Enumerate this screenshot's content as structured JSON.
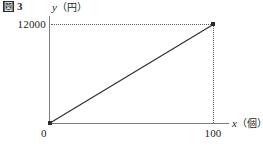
{
  "figure": {
    "caption_marker": "図",
    "caption_number": "3"
  },
  "chart_data": {
    "type": "line",
    "title": "",
    "xlabel": "x（個）",
    "xlabel_var": "x",
    "xlabel_unit": "（個）",
    "ylabel": "y（円）",
    "ylabel_var": "y",
    "ylabel_unit": "（円）",
    "origin_label": "0",
    "x_ticks": [
      "100"
    ],
    "x_tick_values": [
      100
    ],
    "y_ticks": [
      "12000"
    ],
    "y_tick_values": [
      12000
    ],
    "xlim": [
      0,
      110
    ],
    "ylim": [
      0,
      13000
    ],
    "grid": false,
    "legend": null,
    "series": [
      {
        "name": "y = 120x",
        "x": [
          0,
          100
        ],
        "values": [
          0,
          12000
        ],
        "marker": "filled-square",
        "color": "#2b2b2b"
      }
    ],
    "annotations": [
      {
        "type": "dotted-guide",
        "orientation": "horizontal",
        "from": [
          0,
          12000
        ],
        "to": [
          100,
          12000
        ]
      },
      {
        "type": "dotted-guide",
        "orientation": "vertical",
        "from": [
          100,
          12000
        ],
        "to": [
          100,
          0
        ]
      }
    ],
    "points": [
      {
        "label": "origin",
        "x": 0,
        "y": 0
      },
      {
        "label": "endpoint",
        "x": 100,
        "y": 12000
      }
    ]
  },
  "colors": {
    "axis": "#7d7d7d",
    "line": "#4a4a4a",
    "guide": "#5a5a5a",
    "marker": "#2b2b2b",
    "background": "#ffffff",
    "text": "#1e1e1e"
  }
}
